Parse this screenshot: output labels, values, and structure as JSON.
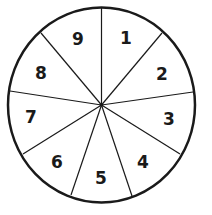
{
  "diagram": {
    "type": "spinner-wheel",
    "sections": 9,
    "center": [
      101.5,
      105
    ],
    "radius": [
      93.5,
      97.5
    ],
    "stroke_color": "#1a1a1a",
    "spokes": [
      [
        101.5,
        8
      ],
      [
        162,
        33
      ],
      [
        193,
        92
      ],
      [
        180,
        154
      ],
      [
        132,
        196
      ],
      [
        71,
        195
      ],
      [
        23,
        154
      ],
      [
        10,
        91
      ],
      [
        41,
        33
      ]
    ],
    "labels": [
      {
        "text": "1",
        "x": 126,
        "y": 38
      },
      {
        "text": "2",
        "x": 162,
        "y": 74
      },
      {
        "text": "3",
        "x": 169,
        "y": 119
      },
      {
        "text": "4",
        "x": 143,
        "y": 162
      },
      {
        "text": "5",
        "x": 101,
        "y": 178
      },
      {
        "text": "6",
        "x": 57,
        "y": 162
      },
      {
        "text": "7",
        "x": 31,
        "y": 117
      },
      {
        "text": "8",
        "x": 41,
        "y": 73
      },
      {
        "text": "9",
        "x": 78,
        "y": 39
      }
    ]
  }
}
